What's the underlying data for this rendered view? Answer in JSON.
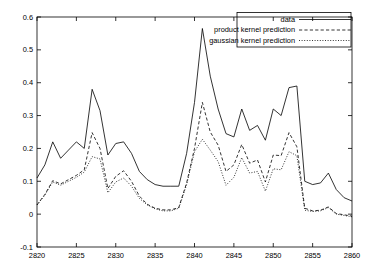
{
  "chart_data": {
    "type": "line",
    "title": "",
    "xlabel": "",
    "ylabel": "",
    "xlim": [
      2820,
      2860
    ],
    "ylim": [
      -0.1,
      0.6
    ],
    "xticks": [
      2820,
      2825,
      2830,
      2835,
      2840,
      2845,
      2850,
      2855,
      2860
    ],
    "xtick_labels": [
      "2820",
      "2825",
      "2830",
      "2835",
      "2840",
      "2845",
      "2850",
      "2855",
      "2860"
    ],
    "yticks": [
      -0.1,
      0,
      0.1,
      0.2,
      0.3,
      0.4,
      0.5,
      0.6
    ],
    "ytick_labels": [
      "-0.1",
      "0",
      "0.1",
      "0.2",
      "0.3",
      "0.4",
      "0.5",
      "0.6"
    ],
    "grid": false,
    "legend_position": "top-right",
    "x": [
      2820,
      2821,
      2822,
      2823,
      2824,
      2825,
      2826,
      2827,
      2828,
      2829,
      2830,
      2831,
      2832,
      2833,
      2834,
      2835,
      2836,
      2837,
      2838,
      2839,
      2840,
      2841,
      2842,
      2843,
      2844,
      2845,
      2846,
      2847,
      2848,
      2849,
      2850,
      2851,
      2852,
      2853,
      2854,
      2855,
      2856,
      2857,
      2858,
      2859,
      2860
    ],
    "series": [
      {
        "name": "data",
        "style": "solid",
        "color": "#000000",
        "values": [
          0.11,
          0.15,
          0.22,
          0.17,
          0.195,
          0.22,
          0.2,
          0.38,
          0.315,
          0.18,
          0.215,
          0.22,
          0.185,
          0.13,
          0.105,
          0.09,
          0.085,
          0.085,
          0.085,
          0.185,
          0.34,
          0.565,
          0.42,
          0.32,
          0.245,
          0.235,
          0.32,
          0.255,
          0.27,
          0.225,
          0.32,
          0.3,
          0.385,
          0.39,
          0.1,
          0.09,
          0.095,
          0.125,
          0.075,
          0.05,
          0.04
        ]
      },
      {
        "name": "product kernel prediction",
        "style": "dashed",
        "color": "#000000",
        "values": [
          0.028,
          0.06,
          0.102,
          0.092,
          0.105,
          0.118,
          0.135,
          0.248,
          0.2,
          0.078,
          0.115,
          0.132,
          0.1,
          0.055,
          0.03,
          0.018,
          0.013,
          0.013,
          0.02,
          0.095,
          0.2,
          0.34,
          0.25,
          0.21,
          0.13,
          0.15,
          0.212,
          0.155,
          0.165,
          0.098,
          0.18,
          0.178,
          0.248,
          0.205,
          0.018,
          0.01,
          0.012,
          0.022,
          0.002,
          -0.002,
          -0.006
        ]
      },
      {
        "name": "gaussian kernel prediction",
        "style": "dotted",
        "color": "#000000",
        "values": [
          0.028,
          0.058,
          0.098,
          0.088,
          0.1,
          0.112,
          0.128,
          0.175,
          0.168,
          0.065,
          0.098,
          0.11,
          0.085,
          0.048,
          0.028,
          0.016,
          0.01,
          0.01,
          0.018,
          0.09,
          0.19,
          0.228,
          0.195,
          0.16,
          0.088,
          0.112,
          0.172,
          0.125,
          0.13,
          0.07,
          0.138,
          0.135,
          0.19,
          0.178,
          0.012,
          0.008,
          0.01,
          0.02,
          0.0,
          -0.004,
          -0.008
        ]
      }
    ]
  },
  "legend": {
    "entries": [
      {
        "label": "data"
      },
      {
        "label": "product kernel prediction"
      },
      {
        "label": "gaussian kernel prediction"
      }
    ]
  }
}
